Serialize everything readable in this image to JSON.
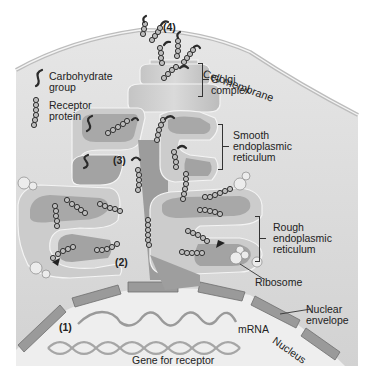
{
  "figure": {
    "colors": {
      "cytoplasm": "#d9d9d9",
      "nucleus": "#ececec",
      "organelle_light": "#cfcfcf",
      "organelle_dark": "#9e9e9e",
      "membrane_edge": "#f7f7f7",
      "envelope": "#8c8c8c",
      "protein_bead": "#bdbdbd",
      "text": "#222222"
    }
  },
  "legend": {
    "carbohydrate": {
      "icon": "carbohydrate-squiggle-icon",
      "label_line1": "Carbohydrate",
      "label_line2": "group"
    },
    "receptor": {
      "icon": "bead-chain-icon",
      "label_line1": "Receptor",
      "label_line2": "protein"
    }
  },
  "labels": {
    "cell_membrane": "Cell membrane",
    "golgi": {
      "line1": "Golgi",
      "line2": "complex"
    },
    "smooth_er": {
      "line1": "Smooth",
      "line2": "endoplasmic",
      "line3": "reticulum"
    },
    "rough_er": {
      "line1": "Rough",
      "line2": "endoplasmic",
      "line3": "reticulum"
    },
    "ribosome": "Ribosome",
    "nuclear_envelope": {
      "line1": "Nuclear",
      "line2": "envelope"
    },
    "nucleus": "Nucleus",
    "mrna": "mRNA",
    "gene": "Gene for receptor"
  },
  "steps": {
    "s1": "(1)",
    "s2": "(2)",
    "s3": "(3)",
    "s4": "(4)"
  }
}
